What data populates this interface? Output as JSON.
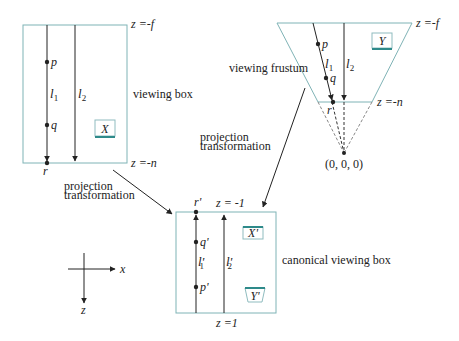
{
  "viewing_box": {
    "label": "viewing box",
    "far_label": "z =-f",
    "near_label": "z =-n",
    "points": [
      "p",
      "q",
      "r"
    ],
    "lines": [
      "l",
      "l"
    ],
    "line_subs": [
      "1",
      "2"
    ],
    "object": "X"
  },
  "viewing_frustum": {
    "label": "viewing frustum",
    "far_label": "z =-f",
    "near_label": "z =-n",
    "points": [
      "p",
      "q",
      "r"
    ],
    "lines": [
      "l",
      "l"
    ],
    "line_subs": [
      "1",
      "2"
    ],
    "object": "Y",
    "origin_label": "(0, 0, 0)"
  },
  "canonical_box": {
    "label": "canonical viewing box",
    "top_label": "z = -1",
    "bottom_label": "z =1",
    "points": [
      "r'",
      "q'",
      "p'"
    ],
    "lines": [
      "l'",
      "l'"
    ],
    "line_subs": [
      "1",
      "2"
    ],
    "objects": [
      "X'",
      "Y'"
    ]
  },
  "arrows": {
    "left_label_1": "projection",
    "left_label_2": "transformation",
    "right_label_1": "projection",
    "right_label_2": "transformation"
  },
  "axes": {
    "x_label": "x",
    "z_label": "z"
  },
  "colors": {
    "box_stroke": "#7fb3b6",
    "object_accent": "#2e8a8a",
    "ink": "#222222"
  }
}
